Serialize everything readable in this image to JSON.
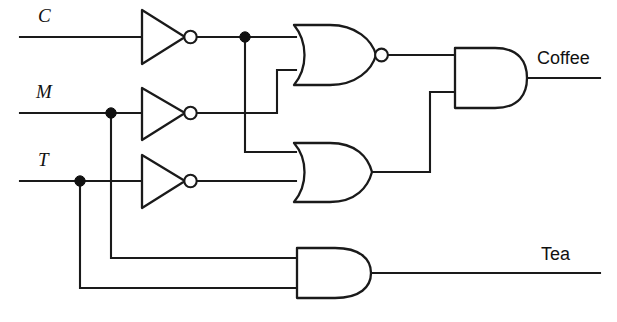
{
  "diagram": {
    "type": "logic-circuit-schematic",
    "line_color": "#1a1a1a",
    "background_color": "#ffffff"
  },
  "inputs": [
    {
      "id": "C",
      "label": "C",
      "label_x": 38,
      "label_y": 22,
      "wire_y": 37
    },
    {
      "id": "M",
      "label": "M",
      "label_x": 36,
      "label_y": 98,
      "wire_y": 113
    },
    {
      "id": "T",
      "label": "T",
      "label_x": 38,
      "label_y": 166,
      "wire_y": 181
    }
  ],
  "outputs": [
    {
      "id": "coffee",
      "label": "Coffee",
      "label_x": 537,
      "label_y": 64,
      "wire_y": 78
    },
    {
      "id": "tea",
      "label": "Tea",
      "label_x": 541,
      "label_y": 260,
      "wire_y": 273
    }
  ],
  "gates": [
    {
      "id": "inv-c",
      "type": "NOT",
      "label": "inverter-c",
      "x": 142,
      "y": 37
    },
    {
      "id": "inv-m",
      "type": "NOT",
      "label": "inverter-m",
      "x": 142,
      "y": 113
    },
    {
      "id": "inv-t",
      "type": "NOT",
      "label": "inverter-t",
      "x": 142,
      "y": 181
    },
    {
      "id": "nor-1",
      "type": "NOR",
      "label": "nor-gate",
      "x": 296,
      "y": 55
    },
    {
      "id": "or-1",
      "type": "OR",
      "label": "or-gate",
      "x": 296,
      "y": 172
    },
    {
      "id": "and-coffee",
      "type": "AND",
      "label": "and-gate-coffee",
      "x": 455,
      "y": 78
    },
    {
      "id": "and-tea",
      "type": "AND",
      "label": "and-gate-tea",
      "x": 297,
      "y": 273
    }
  ],
  "junctions": [
    {
      "id": "j-cinv",
      "x": 245,
      "y": 37,
      "on": "inverter-c-output"
    },
    {
      "id": "j-m",
      "x": 111,
      "y": 113,
      "on": "m-input"
    },
    {
      "id": "j-t",
      "x": 80,
      "y": 181,
      "on": "t-input"
    }
  ],
  "nets": {
    "c_input": "M 20 37 L 142 37",
    "inv_c_out": "M 196 37 L 296 37",
    "m_input": "M 20 113 L 142 113",
    "inv_m_out": "M 196 113 L 277 113 L 277 70 L 296 70",
    "t_input": "M 20 181 L 142 181",
    "inv_t_out": "M 196 181 L 296 181",
    "cinv_to_or": "M 245 37 L 245 152 L 296 152",
    "nor_out": "M 382 55 L 455 55",
    "or_out": "M 372 172 L 430 172 L 430 92 L 455 92",
    "coffee_out": "M 525 78 L 600 78",
    "m_to_and_tea": "M 111 113 L 111 258 L 297 258",
    "t_to_and_tea": "M 80 181 L 80 288 L 297 288",
    "tea_out": "M 372 273 L 600 273"
  }
}
